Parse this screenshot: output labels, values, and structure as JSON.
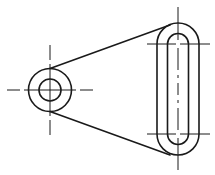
{
  "drawing": {
    "title": "",
    "colors": {
      "line": "#1a1a1a",
      "background": "#ffffff"
    },
    "left_boss": {
      "center": [
        50,
        90
      ],
      "outer_radius": 21.5,
      "hole_radius": 11
    },
    "right_slot": {
      "center_x": 178,
      "top_center_y": 44,
      "bottom_center_y": 134,
      "outer_half_width": 21,
      "inner_half_width": 10.5
    },
    "tangents": {
      "upper": [
        [
          50,
          68.5
        ],
        [
          170,
          25
        ]
      ],
      "lower": [
        [
          50,
          111.5
        ],
        [
          170,
          155
        ]
      ]
    },
    "centerlines": {
      "left_horizontal": [
        7,
        93
      ],
      "left_vertical": [
        45,
        135
      ],
      "right_vertical": [
        7,
        170
      ],
      "right_horizontals_x": [
        147,
        210
      ]
    }
  }
}
